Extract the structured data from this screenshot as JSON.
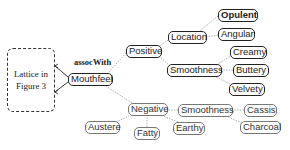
{
  "diagram": {
    "lattice_box": {
      "line1": "Lattice in",
      "line2": "Figure 3"
    },
    "edge_label": "assocWith",
    "nodes": {
      "mouthfeel": "Mouthfeel",
      "positive": "Positive",
      "location": "Location",
      "opulent": "Opulent",
      "angular": "Angular",
      "creamy": "Creamy",
      "smoothness_pos": "Smoothness",
      "buttery": "Buttery",
      "velvety": "Velvety",
      "negative": "Negative",
      "smoothness_neg": "Smoothness",
      "cassis": "Cassis",
      "austere": "Austere",
      "fatty": "Fatty",
      "earthy": "Earthy",
      "charcoal": "Charcoal"
    },
    "edges": [
      [
        "Mouthfeel",
        "Lattice in Figure 3",
        "assocWith"
      ],
      [
        "Positive",
        "Mouthfeel"
      ],
      [
        "Negative",
        "Mouthfeel"
      ],
      [
        "Location",
        "Positive"
      ],
      [
        "Smoothness",
        "Positive"
      ],
      [
        "Opulent",
        "Location"
      ],
      [
        "Angular",
        "Location"
      ],
      [
        "Creamy",
        "Smoothness"
      ],
      [
        "Buttery",
        "Smoothness"
      ],
      [
        "Velvety",
        "Smoothness"
      ],
      [
        "Smoothness",
        "Negative"
      ],
      [
        "Cassis",
        "Smoothness"
      ],
      [
        "Charcoal",
        "Smoothness"
      ],
      [
        "Austere",
        "Negative"
      ],
      [
        "Fatty",
        "Negative"
      ],
      [
        "Earthy",
        "Negative"
      ]
    ],
    "colors": {
      "strong_border": "#222222",
      "weak_border": "#777777",
      "edge": "#999999"
    }
  }
}
